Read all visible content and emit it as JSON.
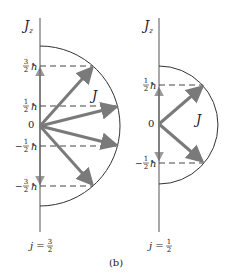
{
  "figure": {
    "caption": "(b)",
    "colors": {
      "axis": "#555555",
      "arc": "#333333",
      "vector": "#7a7a7a",
      "projection": "#9a9a9a",
      "dashed": "#444444",
      "text": "#222222"
    }
  },
  "left_panel": {
    "axis_label": "J",
    "axis_subscript": "z",
    "vector_label": "J",
    "origin_label": "0",
    "j_label": "j =",
    "j_value_num": "3",
    "j_value_den": "2",
    "levels": [
      {
        "num": "3",
        "den": "2",
        "sign": "",
        "unit": "ħ"
      },
      {
        "num": "1",
        "den": "2",
        "sign": "",
        "unit": "ħ"
      },
      {
        "num": "1",
        "den": "2",
        "sign": "−",
        "unit": "ħ"
      },
      {
        "num": "3",
        "den": "2",
        "sign": "−",
        "unit": "ħ"
      }
    ]
  },
  "right_panel": {
    "axis_label": "J",
    "axis_subscript": "z",
    "vector_label": "J",
    "origin_label": "0",
    "j_label": "j =",
    "j_value_num": "1",
    "j_value_den": "2",
    "levels": [
      {
        "num": "1",
        "den": "2",
        "sign": "",
        "unit": "ħ"
      },
      {
        "num": "1",
        "den": "2",
        "sign": "−",
        "unit": "ħ"
      }
    ]
  }
}
